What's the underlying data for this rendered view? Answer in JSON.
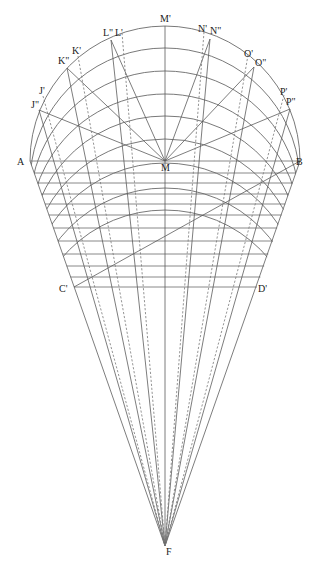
{
  "figure": {
    "stroke_color": "#6a6a6a",
    "label_color": "#222222",
    "background": "#ffffff"
  },
  "points": {
    "M": {
      "x": 165,
      "y": 161
    },
    "M_prime": {
      "x": 165,
      "y": 26
    },
    "A": {
      "x": 30,
      "y": 161
    },
    "B": {
      "x": 300,
      "y": 161
    },
    "C_prime": {
      "x": 74,
      "y": 287
    },
    "D_prime": {
      "x": 257,
      "y": 287
    },
    "F": {
      "x": 165,
      "y": 546
    },
    "J2": {
      "x": 39,
      "y": 110
    },
    "K2": {
      "x": 67,
      "y": 68
    },
    "L2": {
      "x": 111,
      "y": 40
    },
    "N2": {
      "x": 210,
      "y": 39
    },
    "O2": {
      "x": 254,
      "y": 67
    },
    "P2": {
      "x": 290,
      "y": 109
    },
    "J1": {
      "x": 43,
      "y": 96
    },
    "K1": {
      "x": 78,
      "y": 56
    },
    "L1": {
      "x": 122,
      "y": 33
    },
    "N1": {
      "x": 204,
      "y": 32
    },
    "O1": {
      "x": 248,
      "y": 55
    },
    "P1": {
      "x": 284,
      "y": 95
    }
  },
  "labels": [
    {
      "id": "M_prime",
      "text": "M'",
      "x": 160,
      "y": 22
    },
    {
      "id": "L2",
      "text": "L\"",
      "x": 103,
      "y": 36
    },
    {
      "id": "L1",
      "text": "L'",
      "x": 115,
      "y": 36
    },
    {
      "id": "N1",
      "text": "N'",
      "x": 198,
      "y": 32
    },
    {
      "id": "N2",
      "text": "N\"",
      "x": 210,
      "y": 34
    },
    {
      "id": "K1",
      "text": "K'",
      "x": 72,
      "y": 54
    },
    {
      "id": "K2",
      "text": "K\"",
      "x": 58,
      "y": 64
    },
    {
      "id": "O1",
      "text": "O'",
      "x": 244,
      "y": 57
    },
    {
      "id": "O2",
      "text": "O\"",
      "x": 255,
      "y": 66
    },
    {
      "id": "J1",
      "text": "J'",
      "x": 39,
      "y": 94
    },
    {
      "id": "J2",
      "text": "J\"",
      "x": 31,
      "y": 108
    },
    {
      "id": "P1",
      "text": "P'",
      "x": 280,
      "y": 95
    },
    {
      "id": "P2",
      "text": "P\"",
      "x": 286,
      "y": 105
    },
    {
      "id": "A",
      "text": "A",
      "x": 17,
      "y": 165
    },
    {
      "id": "M",
      "text": "M",
      "x": 161,
      "y": 171
    },
    {
      "id": "B",
      "text": "B",
      "x": 296,
      "y": 165
    },
    {
      "id": "C_prime",
      "text": "C'",
      "x": 59,
      "y": 292
    },
    {
      "id": "D_prime",
      "text": "D'",
      "x": 258,
      "y": 292
    },
    {
      "id": "F",
      "text": "F",
      "x": 166,
      "y": 555
    }
  ],
  "arcs": {
    "radius": 135,
    "center_x": 165,
    "center_ys": [
      161,
      183,
      206,
      229,
      251,
      274,
      298,
      323,
      345
    ],
    "note": "translated copies of the outer semicircle, clipped to the trapezoid A-B-D'-C'"
  },
  "hlines": [
    161,
    173,
    183,
    194,
    204,
    215,
    228,
    241,
    254,
    266,
    277,
    287
  ],
  "lines_to_M": [
    "J2",
    "K2",
    "L2",
    "N2",
    "O2",
    "P2"
  ],
  "lines_to_F": [
    "A",
    "J2",
    "K2",
    "L2",
    "M_prime",
    "N2",
    "O2",
    "P2",
    "B"
  ],
  "dashed_to_F": [
    "J1",
    "K1",
    "L1",
    "N1",
    "O1",
    "P1"
  ],
  "diagonal": {
    "from": "C_prime",
    "to": "B"
  }
}
